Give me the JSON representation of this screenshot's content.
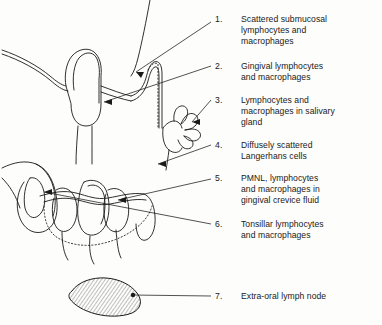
{
  "figure": {
    "background_color": "#fdfdfb",
    "ink_color": "#1a1a1a"
  },
  "legend": {
    "items": [
      {
        "number": "1.",
        "text": "Scattered submucosal\nlymphocytes and\nmacrophages"
      },
      {
        "number": "2.",
        "text": "Gingival lymphocytes\nand macrophages"
      },
      {
        "number": "3.",
        "text": "Lymphocytes and\nmacrophages in salivary\ngland"
      },
      {
        "number": "4.",
        "text": "Diffusely scattered\nLangerhans cells"
      },
      {
        "number": "5.",
        "text": "PMNL, lymphocytes\nand macrophages in\ngingival crevice fluid"
      },
      {
        "number": "6.",
        "text": "Tonsillar lymphocytes\nand macrophages"
      },
      {
        "number": "7.",
        "text": "Extra-oral lymph node"
      }
    ]
  },
  "anatomy": {
    "parts": [
      "soft-palate-mucosa",
      "uvula",
      "tonsil",
      "salivary-gland",
      "tongue",
      "gingiva",
      "teeth",
      "extra-oral-lymph-node"
    ]
  }
}
